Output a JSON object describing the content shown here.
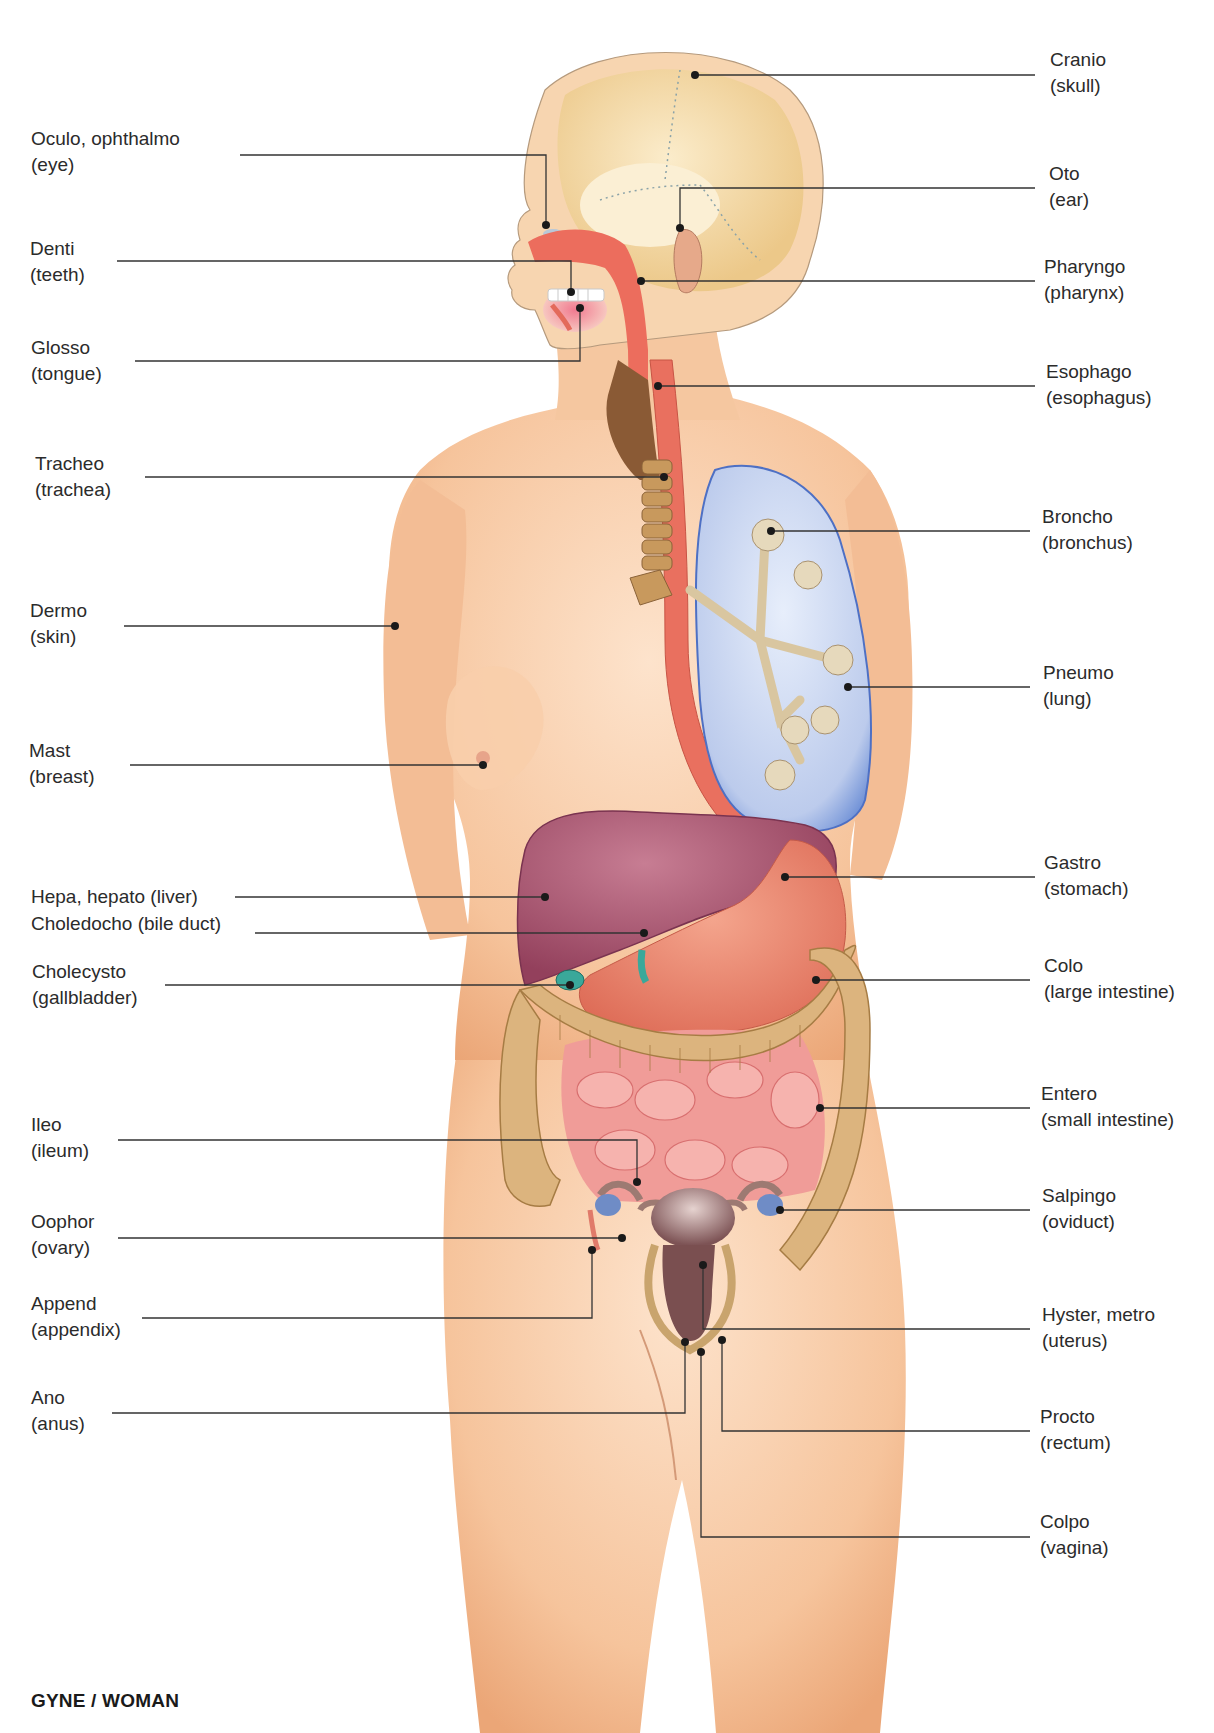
{
  "title": "GYNE / WOMAN",
  "colors": {
    "skin": "#f6c9a3",
    "skin_shadow": "#eaa87a",
    "skull": "#f0d6a6",
    "pharynx_red": "#e86a5c",
    "lung_blue": "#b9c8ea",
    "lung_edge": "#4a6cc0",
    "liver": "#a4506a",
    "stomach": "#e57a66",
    "colon": "#d9b27a",
    "small_intestine": "#ef8f8a",
    "uterus": "#8a5a5a",
    "ovary": "#6f8cc6",
    "leader_line": "#333333"
  },
  "labels_left": [
    {
      "term": "Oculo, ophthalmo",
      "meaning": "(eye)"
    },
    {
      "term": "Denti",
      "meaning": "(teeth)"
    },
    {
      "term": "Glosso",
      "meaning": "(tongue)"
    },
    {
      "term": "Tracheo",
      "meaning": "(trachea)"
    },
    {
      "term": "Dermo",
      "meaning": "(skin)"
    },
    {
      "term": "Mast",
      "meaning": "(breast)"
    },
    {
      "term": "Hepa, hepato (liver)",
      "meaning": ""
    },
    {
      "term": "Choledocho (bile duct)",
      "meaning": ""
    },
    {
      "term": "Cholecysto",
      "meaning": "(gallbladder)"
    },
    {
      "term": "Ileo",
      "meaning": "(ileum)"
    },
    {
      "term": "Oophor",
      "meaning": "(ovary)"
    },
    {
      "term": "Append",
      "meaning": "(appendix)"
    },
    {
      "term": "Ano",
      "meaning": "(anus)"
    }
  ],
  "labels_right": [
    {
      "term": "Cranio",
      "meaning": "(skull)"
    },
    {
      "term": "Oto",
      "meaning": "(ear)"
    },
    {
      "term": "Pharyngo",
      "meaning": "(pharynx)"
    },
    {
      "term": "Esophago",
      "meaning": "(esophagus)"
    },
    {
      "term": "Broncho",
      "meaning": "(bronchus)"
    },
    {
      "term": "Pneumo",
      "meaning": "(lung)"
    },
    {
      "term": "Gastro",
      "meaning": "(stomach)"
    },
    {
      "term": "Colo",
      "meaning": "(large intestine)"
    },
    {
      "term": "Entero",
      "meaning": "(small intestine)"
    },
    {
      "term": "Salpingo",
      "meaning": "(oviduct)"
    },
    {
      "term": "Hyster, metro",
      "meaning": "(uterus)"
    },
    {
      "term": "Procto",
      "meaning": "(rectum)"
    },
    {
      "term": "Colpo",
      "meaning": "(vagina)"
    }
  ]
}
